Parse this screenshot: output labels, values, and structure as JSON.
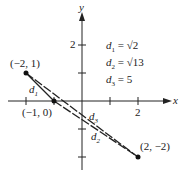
{
  "axes": {
    "x_label": "x",
    "y_label": "y",
    "tick_x": "2",
    "tick_y": "2"
  },
  "points": [
    {
      "label": "(−2, 1)",
      "x": -2,
      "y": 1
    },
    {
      "label": "(−1, 0)",
      "x": -1,
      "y": 0
    },
    {
      "label": "(2, −2)",
      "x": 2,
      "y": -2
    }
  ],
  "segments": [
    {
      "name": "d1",
      "label": "d",
      "sub": "1",
      "from": "(−2, 1)",
      "to": "(−1, 0)"
    },
    {
      "name": "d2",
      "label": "d",
      "sub": "2",
      "from": "(−1, 0)",
      "to": "(2, −2)"
    },
    {
      "name": "d3",
      "label": "d",
      "sub": "3",
      "from": "(−2, 1)",
      "to": "(2, −2)"
    }
  ],
  "legend": [
    {
      "var": "d",
      "sub": "1",
      "eq": "= √2"
    },
    {
      "var": "d",
      "sub": "2",
      "eq": "= √13"
    },
    {
      "var": "d",
      "sub": "3",
      "eq": "= 5"
    }
  ]
}
